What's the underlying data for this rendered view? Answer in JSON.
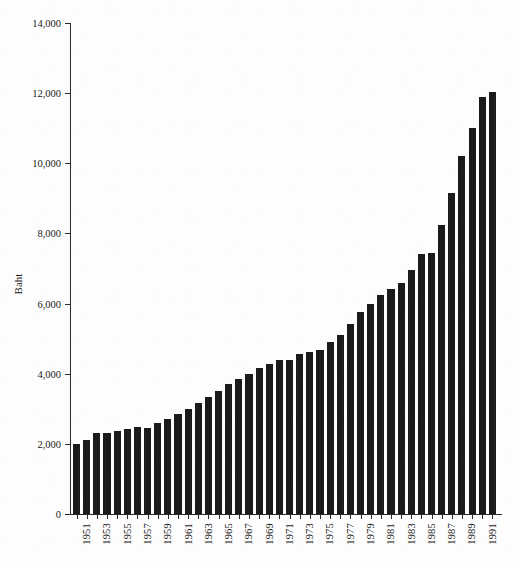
{
  "chart_data": {
    "type": "bar",
    "title": "",
    "xlabel": "",
    "ylabel": "Baht",
    "ylim": [
      0,
      14000
    ],
    "ytick_step": 2000,
    "yticks": [
      0,
      2000,
      4000,
      6000,
      8000,
      10000,
      12000,
      14000
    ],
    "ytick_labels": [
      "0",
      "2,000",
      "4,000",
      "6,000",
      "8,000",
      "10,000",
      "12,000",
      "14,000"
    ],
    "grid": false,
    "legend": null,
    "bar_color": "#1b1b1b",
    "axis_color": "#2b2b2b",
    "xtick_label_rotation": -90,
    "xtick_label_interval": 2,
    "categories": [
      "1951",
      "1952",
      "1953",
      "1954",
      "1955",
      "1956",
      "1957",
      "1958",
      "1959",
      "1960",
      "1961",
      "1962",
      "1963",
      "1964",
      "1965",
      "1966",
      "1967",
      "1968",
      "1969",
      "1970",
      "1971",
      "1972",
      "1973",
      "1974",
      "1975",
      "1976",
      "1977",
      "1978",
      "1979",
      "1980",
      "1981",
      "1982",
      "1983",
      "1984",
      "1985",
      "1986",
      "1987",
      "1988",
      "1989",
      "1990",
      "1991",
      "1992"
    ],
    "xtick_labels_shown": [
      "1951",
      "1953",
      "1955",
      "1957",
      "1959",
      "1961",
      "1963",
      "1965",
      "1967",
      "1969",
      "1971",
      "1973",
      "1975",
      "1977",
      "1979",
      "1981",
      "1983",
      "1985",
      "1987",
      "1989",
      "1991"
    ],
    "values": [
      2000,
      2120,
      2300,
      2320,
      2360,
      2420,
      2470,
      2460,
      2600,
      2700,
      2850,
      3000,
      3170,
      3330,
      3520,
      3720,
      3840,
      3980,
      4150,
      4280,
      4380,
      4380,
      4550,
      4630,
      4680,
      4900,
      5100,
      5420,
      5750,
      5980,
      6240,
      6430,
      6600,
      6960,
      7400,
      7450,
      8230,
      9150,
      10200,
      11000,
      11900,
      12030
    ]
  },
  "axis": {
    "y_label": "Baht"
  }
}
